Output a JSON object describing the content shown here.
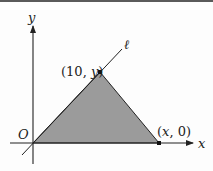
{
  "diagram": {
    "type": "coordinate-geometry",
    "axes": {
      "x_label": "x",
      "y_label": "y",
      "origin_label": "O"
    },
    "line": {
      "label": "ℓ"
    },
    "points": {
      "apex": {
        "label": "(10, y)",
        "x_part": "10",
        "y_part": "y"
      },
      "base_right": {
        "label": "(x, 0)",
        "x_part": "x",
        "y_part": "0"
      }
    },
    "colors": {
      "fill": "#9b9b9b",
      "stroke": "#222222",
      "background": "#fdfdfd"
    }
  }
}
